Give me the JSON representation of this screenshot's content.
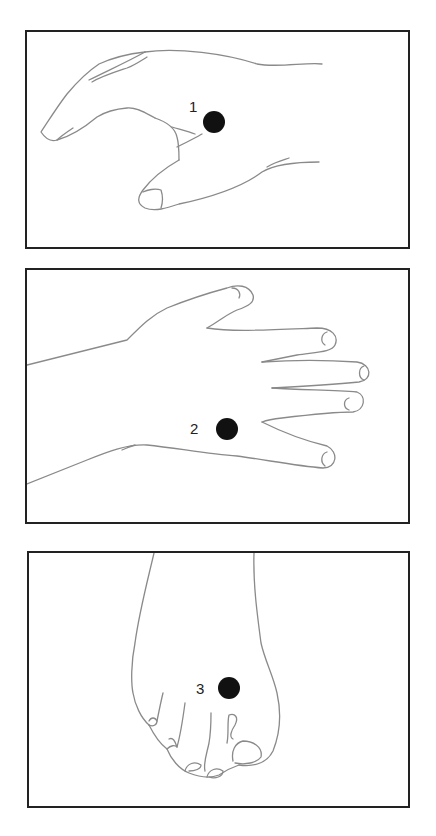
{
  "figure": {
    "panels": [
      {
        "id": 1,
        "subject": "hand-side-view",
        "point_label": "1"
      },
      {
        "id": 2,
        "subject": "hand-dorsal-view",
        "point_label": "2"
      },
      {
        "id": 3,
        "subject": "foot-dorsal-view",
        "point_label": "3"
      }
    ],
    "colors": {
      "line": "#8a8a8a",
      "border": "#222222",
      "dot": "#111111",
      "background": "#ffffff"
    }
  }
}
